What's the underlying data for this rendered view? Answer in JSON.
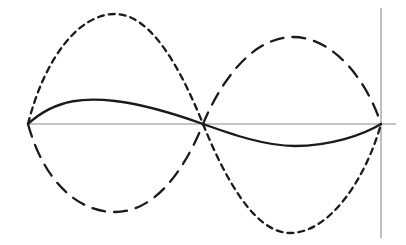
{
  "figure": {
    "title": "",
    "background_color": "#ffffff",
    "width": 406,
    "height": 245
  },
  "axes": {
    "horizontal": {
      "name": "horizontal-axis",
      "color": "#8a8a8a",
      "stroke_width": 1.1,
      "x1": 28,
      "y1": 124,
      "x2": 396,
      "y2": 124
    },
    "vertical": {
      "name": "vertical-axis",
      "color": "#8a8a8a",
      "stroke_width": 1.1,
      "x1": 381,
      "y1": 8,
      "x2": 381,
      "y2": 238
    }
  },
  "nodes": {
    "left_end_x": 28,
    "center_x": 203,
    "right_end_x": 381,
    "baseline_y": 124
  },
  "chart_data": {
    "type": "line",
    "title": "",
    "subtitle": "",
    "xlabel": "",
    "ylabel": "",
    "xlim": [
      0,
      1
    ],
    "ylim": [
      -1,
      1
    ],
    "grid": false,
    "legend_position": "none",
    "annotations": [],
    "x_tick_labels": [],
    "y_tick_labels": [],
    "series": [
      {
        "name": "mode-solid",
        "style": "solid",
        "color": "#1a1a1a",
        "stroke_width": 2.3,
        "dash_array": "none",
        "amplitude_px": 23,
        "cycles": 1,
        "phase": "positive-first",
        "peak": {
          "x": 115,
          "y": 101
        },
        "trough": {
          "x": 295,
          "y": 146
        },
        "path": "M 28 124 C 57 97, 90 98, 115 101 C 148 105, 178 115, 203 124 C 231 134, 265 146, 295 146 C 330 146, 363 135, 381 124"
      },
      {
        "name": "mode-short-dash",
        "style": "dashed-short",
        "color": "#1a1a1a",
        "stroke_width": 2.3,
        "dash_array": "6 5",
        "amplitude_px": 110,
        "cycles": 1,
        "phase": "positive-first",
        "peak": {
          "x": 115,
          "y": 14
        },
        "trough": {
          "x": 290,
          "y": 233
        },
        "path": "M 28 124 C 44 60, 78 14, 115 14 C 152 14, 182 72, 203 124 C 224 176, 254 233, 290 233 C 330 233, 366 178, 381 124"
      },
      {
        "name": "mode-long-dash",
        "style": "dashed-long",
        "color": "#1a1a1a",
        "stroke_width": 2.3,
        "dash_array": "13 9",
        "amplitude_px": 88,
        "cycles": 1,
        "phase": "negative-first",
        "trough": {
          "x": 115,
          "y": 212
        },
        "peak": {
          "x": 293,
          "y": 37
        },
        "path": "M 28 124 C 44 182, 78 212, 115 212 C 152 212, 182 176, 203 124 C 224 74, 256 37, 293 37 C 332 37, 366 78, 381 124"
      }
    ]
  }
}
